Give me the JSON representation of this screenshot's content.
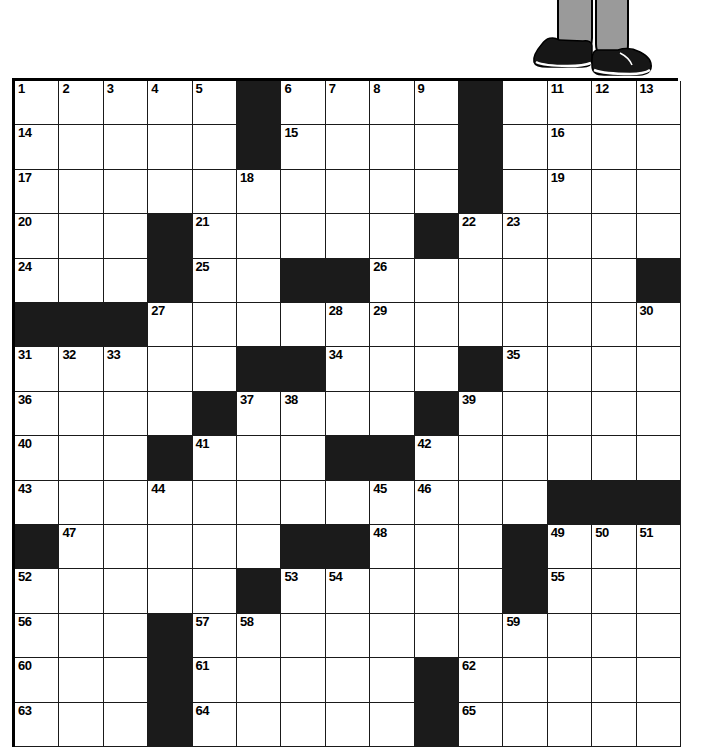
{
  "page": {
    "background_color": "#ffffff"
  },
  "illustration": {
    "name": "legs-in-shoes-illustration",
    "description": "Lower legs in gray trousers wearing black shoes standing on the top edge of the crossword grid",
    "trouser_color": "#9a9a9a",
    "shoe_color": "#161616",
    "outline_color": "#000000"
  },
  "grid": {
    "columns": 15,
    "rows": 15,
    "cell_size": 44.4,
    "line_color": "#1a1a1a",
    "black_color": "#1b1b1b",
    "white_color": "#ffffff",
    "border_color": "#000000",
    "black_squares": [
      [
        1,
        6
      ],
      [
        1,
        11
      ],
      [
        2,
        6
      ],
      [
        2,
        11
      ],
      [
        3,
        11
      ],
      [
        4,
        4
      ],
      [
        4,
        10
      ],
      [
        5,
        4
      ],
      [
        5,
        7
      ],
      [
        5,
        8
      ],
      [
        5,
        15
      ],
      [
        6,
        1
      ],
      [
        6,
        2
      ],
      [
        6,
        3
      ],
      [
        7,
        6
      ],
      [
        7,
        7
      ],
      [
        7,
        11
      ],
      [
        8,
        5
      ],
      [
        8,
        10
      ],
      [
        9,
        4
      ],
      [
        9,
        8
      ],
      [
        9,
        9
      ],
      [
        10,
        13
      ],
      [
        10,
        14
      ],
      [
        10,
        15
      ],
      [
        11,
        1
      ],
      [
        11,
        7
      ],
      [
        11,
        8
      ],
      [
        11,
        12
      ],
      [
        12,
        6
      ],
      [
        12,
        12
      ],
      [
        13,
        4
      ],
      [
        14,
        4
      ],
      [
        14,
        10
      ],
      [
        15,
        4
      ],
      [
        15,
        10
      ]
    ],
    "numbers": [
      {
        "n": 1,
        "row": 1,
        "col": 1
      },
      {
        "n": 2,
        "row": 1,
        "col": 2
      },
      {
        "n": 3,
        "row": 1,
        "col": 3
      },
      {
        "n": 4,
        "row": 1,
        "col": 4
      },
      {
        "n": 5,
        "row": 1,
        "col": 5
      },
      {
        "n": 6,
        "row": 1,
        "col": 7
      },
      {
        "n": 7,
        "row": 1,
        "col": 8
      },
      {
        "n": 8,
        "row": 1,
        "col": 9
      },
      {
        "n": 9,
        "row": 1,
        "col": 10
      },
      {
        "n": 10,
        "row": 1,
        "col": 11
      },
      {
        "n": 11,
        "row": 1,
        "col": 13
      },
      {
        "n": 12,
        "row": 1,
        "col": 14
      },
      {
        "n": 13,
        "row": 1,
        "col": 15
      },
      {
        "n": 14,
        "row": 2,
        "col": 1
      },
      {
        "n": 15,
        "row": 2,
        "col": 7
      },
      {
        "n": 16,
        "row": 2,
        "col": 13
      },
      {
        "n": 17,
        "row": 3,
        "col": 1
      },
      {
        "n": 18,
        "row": 3,
        "col": 6
      },
      {
        "n": 19,
        "row": 3,
        "col": 13
      },
      {
        "n": 20,
        "row": 4,
        "col": 1
      },
      {
        "n": 21,
        "row": 4,
        "col": 5
      },
      {
        "n": 22,
        "row": 4,
        "col": 11
      },
      {
        "n": 23,
        "row": 4,
        "col": 12
      },
      {
        "n": 24,
        "row": 5,
        "col": 1
      },
      {
        "n": 25,
        "row": 5,
        "col": 5
      },
      {
        "n": 26,
        "row": 5,
        "col": 9
      },
      {
        "n": 27,
        "row": 6,
        "col": 4
      },
      {
        "n": 28,
        "row": 6,
        "col": 8
      },
      {
        "n": 29,
        "row": 6,
        "col": 9
      },
      {
        "n": 30,
        "row": 6,
        "col": 15
      },
      {
        "n": 31,
        "row": 7,
        "col": 1
      },
      {
        "n": 32,
        "row": 7,
        "col": 2
      },
      {
        "n": 33,
        "row": 7,
        "col": 3
      },
      {
        "n": 34,
        "row": 7,
        "col": 8
      },
      {
        "n": 35,
        "row": 7,
        "col": 12
      },
      {
        "n": 36,
        "row": 8,
        "col": 1
      },
      {
        "n": 37,
        "row": 8,
        "col": 6
      },
      {
        "n": 38,
        "row": 8,
        "col": 7
      },
      {
        "n": 39,
        "row": 8,
        "col": 11
      },
      {
        "n": 40,
        "row": 9,
        "col": 1
      },
      {
        "n": 41,
        "row": 9,
        "col": 5
      },
      {
        "n": 42,
        "row": 9,
        "col": 10
      },
      {
        "n": 43,
        "row": 10,
        "col": 1
      },
      {
        "n": 44,
        "row": 10,
        "col": 4
      },
      {
        "n": 45,
        "row": 10,
        "col": 9
      },
      {
        "n": 46,
        "row": 10,
        "col": 10
      },
      {
        "n": 47,
        "row": 11,
        "col": 2
      },
      {
        "n": 48,
        "row": 11,
        "col": 9
      },
      {
        "n": 49,
        "row": 11,
        "col": 13
      },
      {
        "n": 50,
        "row": 11,
        "col": 14
      },
      {
        "n": 51,
        "row": 11,
        "col": 15
      },
      {
        "n": 52,
        "row": 12,
        "col": 1
      },
      {
        "n": 53,
        "row": 12,
        "col": 7
      },
      {
        "n": 54,
        "row": 12,
        "col": 8
      },
      {
        "n": 55,
        "row": 12,
        "col": 13
      },
      {
        "n": 56,
        "row": 13,
        "col": 1
      },
      {
        "n": 57,
        "row": 13,
        "col": 5
      },
      {
        "n": 58,
        "row": 13,
        "col": 6
      },
      {
        "n": 59,
        "row": 13,
        "col": 12
      },
      {
        "n": 60,
        "row": 14,
        "col": 1
      },
      {
        "n": 61,
        "row": 14,
        "col": 5
      },
      {
        "n": 62,
        "row": 14,
        "col": 11
      },
      {
        "n": 63,
        "row": 15,
        "col": 1
      },
      {
        "n": 64,
        "row": 15,
        "col": 5
      },
      {
        "n": 65,
        "row": 15,
        "col": 11
      }
    ]
  }
}
